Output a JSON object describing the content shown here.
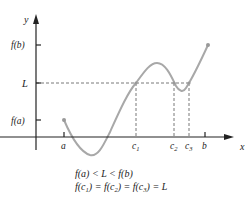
{
  "figure": {
    "axes": {
      "x_label": "x",
      "y_label": "y"
    },
    "y_ticks": [
      {
        "label": "f(b)",
        "y": 45
      },
      {
        "label": "L",
        "y": 83
      },
      {
        "label": "f(a)",
        "y": 120
      }
    ],
    "x_ticks": [
      {
        "label": "a",
        "x": 64
      },
      {
        "label": "c1",
        "x": 136
      },
      {
        "label": "c2",
        "x": 174
      },
      {
        "label": "c3",
        "x": 189
      },
      {
        "label": "b",
        "x": 205
      }
    ],
    "caption": {
      "line1": "f(a) < L < f(b)",
      "line2": "f(c1) = f(c2) = f(c3) = L"
    },
    "colors": {
      "curve": "#a8a8a8",
      "axes": "#222222",
      "dashed": "#555555"
    }
  }
}
